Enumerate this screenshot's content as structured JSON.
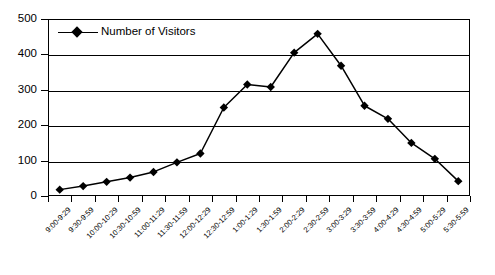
{
  "chart_data": {
    "type": "line",
    "title": "",
    "xlabel": "",
    "ylabel": "",
    "ylim": [
      0,
      500
    ],
    "ytick_step": 100,
    "yticks": [
      0,
      100,
      200,
      300,
      400,
      500
    ],
    "grid": true,
    "legend_position": "top-left-inside",
    "series": [
      {
        "name": "Number of Visitors",
        "marker": "diamond",
        "color": "#000000",
        "values": [
          18,
          28,
          40,
          52,
          68,
          95,
          120,
          250,
          315,
          308,
          405,
          458,
          368,
          255,
          218,
          150,
          105,
          42
        ]
      }
    ],
    "categories": [
      "9:00-9:29",
      "9:30-9:59",
      "10:00-10:29",
      "10:30-10:59",
      "11:00-11:29",
      "11:30-11:59",
      "12:00-12:29",
      "12:30-12:59",
      "1:00-1:29",
      "1:30-1:59",
      "2:00-2:29",
      "2:30-2:59",
      "3:00-3:29",
      "3:30-3:59",
      "4:00-4:29",
      "4:30-4:59",
      "5:00-5:29",
      "5:30-5:59"
    ]
  },
  "legend": {
    "entries": [
      {
        "label": "Number of Visitors"
      }
    ]
  }
}
